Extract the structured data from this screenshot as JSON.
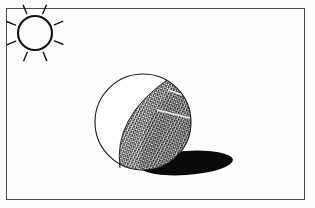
{
  "figure": {
    "frame": {
      "x": 6,
      "y": 8,
      "width": 299,
      "height": 192,
      "stroke_color": "#4a4a4a",
      "fill_color": "#fefefe",
      "stroke_width": 1
    },
    "background_color": "#fdfdfd",
    "ink_color": "#111111"
  },
  "light_source": {
    "name": "sun",
    "center_x": 35,
    "center_y": 33,
    "radius": 17,
    "stroke_width": 2.1,
    "ray_count": 8,
    "ray_inner_offset": 4,
    "ray_length": 9,
    "ray_stroke_width": 1.4,
    "ray_angles_deg": [
      202,
      247,
      292,
      337,
      22,
      67,
      112,
      157
    ]
  },
  "sphere": {
    "name": "shaded-sphere",
    "center_x": 143,
    "center_y": 122,
    "radius": 48,
    "outline_stroke_width": 1.1,
    "lit_fill": "#ffffff",
    "shaded_fill_base": "#2b2b2b",
    "terminator": {
      "top_x": 167,
      "top_y": 80,
      "bottom_x": 120,
      "bottom_y": 168,
      "control_x": 113,
      "control_y": 118
    },
    "highlight_seams": [
      {
        "x1": 168,
        "y1": 90,
        "x2": 186,
        "y2": 96
      },
      {
        "x1": 157,
        "y1": 110,
        "x2": 190,
        "y2": 118
      }
    ]
  },
  "cast_shadow": {
    "name": "ground-shadow",
    "center_x": 186,
    "center_y": 163,
    "radius_x": 47,
    "radius_y": 12,
    "rotation_deg": -4,
    "fill": "#0a0a0a"
  },
  "scene": {
    "title": "Light and shade on a sphere",
    "elements": [
      "sun",
      "sphere",
      "terminator",
      "cast shadow",
      "frame"
    ]
  }
}
